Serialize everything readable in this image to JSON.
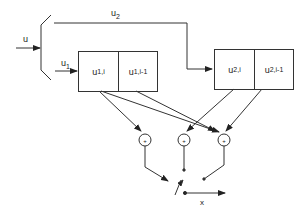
{
  "diagram": {
    "input_label": "u",
    "branch_top_label": "u",
    "branch_top_sub": "2",
    "branch_bottom_label": "u",
    "branch_bottom_sub": "1",
    "register1": {
      "cells": [
        {
          "main": "u",
          "sub": "1,i"
        },
        {
          "main": "u",
          "sub": "1,i-1"
        }
      ]
    },
    "register2": {
      "cells": [
        {
          "main": "u",
          "sub": "2,i"
        },
        {
          "main": "u",
          "sub": "2,i-1"
        }
      ]
    },
    "adders": [
      "+",
      "+",
      "+"
    ],
    "output_label": "x",
    "colors": {
      "line": "#333333",
      "background": "#ffffff"
    }
  }
}
